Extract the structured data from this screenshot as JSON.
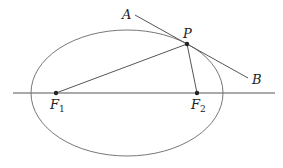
{
  "diagram": {
    "type": "ellipse-reflection",
    "colors": {
      "stroke": "#555555",
      "point": "#222222",
      "text": "#222222",
      "background": "#ffffff"
    },
    "axis": {
      "x1": 13,
      "y1": 93,
      "x2": 275,
      "y2": 93
    },
    "ellipse": {
      "cx": 127,
      "cy": 93,
      "rx": 96,
      "ry": 63
    },
    "points": {
      "F1": {
        "x": 56,
        "y": 93,
        "label": "F",
        "sub": "1"
      },
      "F2": {
        "x": 197,
        "y": 93,
        "label": "F",
        "sub": "2"
      },
      "P": {
        "x": 187,
        "y": 44,
        "label": "P"
      }
    },
    "tangent": {
      "A": {
        "x": 135,
        "y": 15,
        "label": "A"
      },
      "B": {
        "x": 248,
        "y": 78,
        "label": "B"
      }
    },
    "labels": {
      "A": "A",
      "B": "B",
      "P": "P",
      "F1_main": "F",
      "F1_sub": "1",
      "F2_main": "F",
      "F2_sub": "2"
    }
  }
}
